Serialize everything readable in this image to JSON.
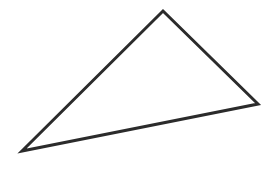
{
  "figure": {
    "name": "triangle",
    "shape_kind": "triangle",
    "background_color": "#ffffff",
    "stroke_color": "#2b2b2b",
    "stroke_width": 3,
    "fill": "none",
    "canvas": {
      "width": 277,
      "height": 184
    },
    "vertices": [
      {
        "label": "apex",
        "x": 163,
        "y": 11
      },
      {
        "label": "right",
        "x": 258,
        "y": 104
      },
      {
        "label": "left",
        "x": 22,
        "y": 151
      }
    ],
    "points_attr": "163,11 258,104 22,151",
    "edges": [
      {
        "label": "left-edge",
        "from": "apex",
        "to": "left"
      },
      {
        "label": "right-edge",
        "from": "apex",
        "to": "right"
      },
      {
        "label": "bottom-edge",
        "from": "left",
        "to": "right"
      }
    ]
  }
}
